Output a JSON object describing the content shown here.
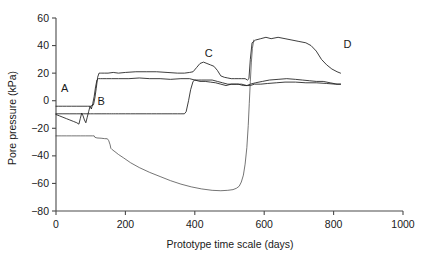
{
  "chart_data": {
    "type": "line",
    "title": "",
    "xlabel": "Prototype time scale (days)",
    "ylabel": "Pore pressure (kPa)",
    "xlim": [
      0,
      1000
    ],
    "ylim": [
      -80,
      60
    ],
    "xticks": [
      0,
      200,
      400,
      600,
      800,
      1000
    ],
    "yticks": [
      -80,
      -60,
      -40,
      -20,
      0,
      20,
      40,
      60
    ],
    "xtick_labels": [
      "0",
      "200",
      "400",
      "600",
      "800",
      "1000"
    ],
    "ytick_labels": [
      "-80",
      "-60",
      "-40",
      "-20",
      "0",
      "20",
      "40",
      "60"
    ],
    "grid": false,
    "legend": "none",
    "annotations": [
      {
        "label": "A",
        "x": 25,
        "y": 6
      },
      {
        "label": "B",
        "x": 130,
        "y": -3
      },
      {
        "label": "C",
        "x": 440,
        "y": 32
      },
      {
        "label": "D",
        "x": 840,
        "y": 38
      }
    ],
    "series": [
      {
        "name": "upper-transducer",
        "x": [
          0,
          8,
          18,
          30,
          45,
          60,
          75,
          90,
          100,
          108,
          112,
          116,
          120,
          124,
          128,
          132,
          140,
          150,
          165,
          180,
          200,
          230,
          260,
          290,
          320,
          350,
          370,
          385,
          395,
          405,
          415,
          425,
          435,
          445,
          455,
          465,
          475,
          485,
          495,
          505,
          515,
          525,
          535,
          545,
          552,
          556,
          560,
          565,
          575,
          590,
          605,
          620,
          640,
          660,
          680,
          700,
          720,
          735,
          750,
          765,
          780,
          795,
          810,
          820
        ],
        "y": [
          -4,
          -4,
          -4,
          -4,
          -4,
          -4,
          -4,
          -4,
          -4,
          -3,
          2,
          9,
          17,
          20,
          20,
          20,
          20,
          20,
          20.5,
          20,
          20.5,
          21,
          21,
          21,
          20.5,
          20,
          20,
          20.5,
          21,
          24,
          27,
          28,
          27,
          26,
          25,
          22,
          18,
          17,
          16.5,
          16,
          16,
          16,
          16,
          16,
          15,
          16,
          30,
          42,
          44,
          45,
          46,
          45,
          46,
          45,
          44,
          43,
          42,
          40,
          36,
          30,
          26,
          23,
          21,
          20
        ],
        "description": "Upper pore pressure transducer; rises from -4 kPa through step at ~110 d to ~20 kPa plateau, peak C ~28 kPa at ~430 d, sharp rise at ~560 d to ~45 kPa plateau, decaying to ~20 kPa at 820 d"
      },
      {
        "name": "mid-transducer",
        "x": [
          0,
          10,
          20,
          30,
          40,
          50,
          60,
          66,
          70,
          74,
          78,
          82,
          86,
          90,
          94,
          98,
          102,
          106,
          110,
          114,
          118,
          122,
          128,
          135,
          145,
          160,
          180,
          210,
          240,
          270,
          300,
          330,
          360,
          385,
          400,
          415,
          430,
          445,
          460,
          475,
          490,
          505,
          520,
          535,
          550,
          560,
          575,
          595,
          615,
          640,
          665,
          690,
          710,
          730,
          750,
          770,
          790,
          810,
          820
        ],
        "y": [
          -10,
          -11,
          -12,
          -13,
          -14,
          -15,
          -16,
          -17,
          -13,
          -9,
          -11,
          -14,
          -16,
          -12,
          -8,
          -4,
          -6,
          -2,
          3,
          10,
          15,
          16,
          16,
          16,
          16,
          16,
          16,
          16,
          16.5,
          16,
          16,
          15.5,
          16,
          16,
          15,
          14,
          14,
          13.5,
          13,
          12,
          11,
          12,
          12,
          12,
          11,
          12,
          13,
          14,
          15,
          15.5,
          16,
          15.5,
          15,
          14.5,
          14,
          14,
          13,
          12,
          12
        ],
        "description": "Middle transducer; oscillates near -10 to -17 kPa until ~110 d, then steps up to ~16 kPa plateau, slight dip near C, ends ~12 kPa"
      },
      {
        "name": "lower-transducer",
        "x": [
          0,
          20,
          40,
          60,
          80,
          100,
          108,
          110,
          118,
          130,
          145,
          155,
          160,
          165,
          172,
          180,
          190,
          200,
          215,
          230,
          245,
          260,
          275,
          290,
          305,
          320,
          335,
          350,
          360,
          370,
          375,
          382,
          388,
          395,
          400,
          410,
          420,
          435,
          450,
          465,
          480,
          495,
          510,
          525,
          540,
          552,
          560,
          572,
          590,
          610,
          635,
          660,
          690,
          720,
          750,
          780,
          805,
          820
        ],
        "y": [
          -9.5,
          -9.5,
          -9.5,
          -9.5,
          -9.5,
          -9.5,
          -9.5,
          -9.5,
          -9.5,
          -9.5,
          -9.5,
          -9.5,
          -9.5,
          -9.5,
          -9.5,
          -9.5,
          -9.5,
          -9.5,
          -9.5,
          -9.5,
          -9.5,
          -9.5,
          -9.5,
          -9.5,
          -9.5,
          -9.5,
          -9.5,
          -9.5,
          -9.5,
          -9.5,
          -8,
          0,
          8,
          14,
          15,
          15,
          15,
          15,
          15,
          14,
          13,
          12,
          12,
          12,
          11,
          11,
          11,
          12,
          12,
          12.5,
          13,
          13.5,
          13.5,
          13,
          13,
          12.5,
          12,
          12
        ],
        "description": "Lower transducer; flat at -9.5 kPa until ~375 d, then steps up to ~15 kPa and settles ~12 kPa"
      },
      {
        "name": "suction-base",
        "x": [
          0,
          15,
          30,
          45,
          60,
          70,
          78,
          85,
          95,
          105,
          110,
          112,
          118,
          130,
          140,
          148,
          152,
          156,
          158,
          162,
          170,
          180,
          195,
          215,
          240,
          270,
          300,
          330,
          360,
          390,
          420,
          450,
          475,
          495,
          510,
          520,
          528,
          534,
          540,
          545,
          550,
          554,
          557,
          560,
          563,
          566,
          570
        ],
        "y": [
          -25.5,
          -25.5,
          -25.5,
          -25.5,
          -25.5,
          -25.5,
          -25.5,
          -25.5,
          -25.5,
          -25.5,
          -25.5,
          -26.5,
          -27,
          -27.2,
          -27.5,
          -27.6,
          -29,
          -32,
          -34.5,
          -35.5,
          -37,
          -39,
          -41.5,
          -45,
          -48.5,
          -52,
          -55,
          -58,
          -60.5,
          -62.5,
          -64,
          -65,
          -65.3,
          -65,
          -64.5,
          -63.5,
          -62,
          -59,
          -54,
          -46,
          -34,
          -18,
          -2,
          14,
          28,
          38,
          44
        ],
        "description": "Base suction curve; starts at -25.5 kPa, small steps down at ~110 and ~155 d, decays smoothly to minimum -65 kPa near 470 d, then rises sharply at ~545 d joining the 45 kPa plateau"
      }
    ]
  }
}
